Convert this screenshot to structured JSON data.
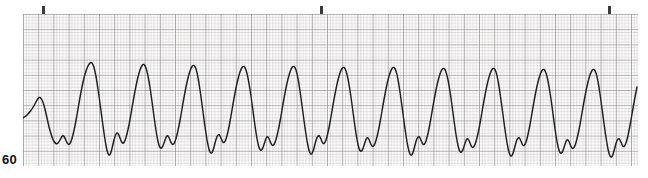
{
  "figure": {
    "name": "ecg-rhythm-strip",
    "kind": "ecg-rhythm-strip",
    "rate_label": "60",
    "background_color": "#ffffff",
    "trace_color": "#1f1f1f",
    "grid_minor_color": "#b9b2b2",
    "grid_major_color": "#8d8585",
    "tick_color": "#3a3a3a",
    "strip": {
      "left": 23,
      "top": 14,
      "width": 615,
      "height": 152,
      "minor_cell_px": 3.04,
      "major_cell_px": 15.2,
      "baseline_y": 104
    },
    "time_ticks": [
      {
        "label": "",
        "x": 19
      },
      {
        "label": "",
        "x": 297
      },
      {
        "label": "",
        "x": 585
      }
    ]
  },
  "chart_data": {
    "type": "line",
    "title": "",
    "subtitle": "",
    "xlabel": "",
    "ylabel": "",
    "grid": "on",
    "legend": "none",
    "annotations": [
      {
        "text": "60",
        "position": "bottom-left",
        "meaning": "rate-marker"
      }
    ],
    "axis": {
      "x_unit": "seconds",
      "y_unit": "millivolts",
      "paper_speed_mm_per_s": 25,
      "gain_mm_per_mV": 10,
      "minor_division_mm": 1,
      "major_division_mm": 5,
      "x_range_s": [
        0,
        6.07
      ],
      "y_range_mV": [
        -2.0,
        3.0
      ]
    },
    "series": [
      {
        "name": "ECG lead trace",
        "beats": 14,
        "beat_period_px": 42.0,
        "first_beat_offset_px": 6,
        "points": [
          [
            0,
            104
          ],
          [
            3,
            102
          ],
          [
            6,
            99
          ],
          [
            9,
            95
          ],
          [
            12,
            90
          ],
          [
            14,
            86
          ],
          [
            16,
            83
          ],
          [
            18,
            84
          ],
          [
            20,
            88
          ],
          [
            22,
            95
          ],
          [
            24,
            104
          ],
          [
            26,
            113
          ],
          [
            28,
            120
          ],
          [
            30,
            126
          ],
          [
            32,
            129
          ],
          [
            34,
            130
          ],
          [
            36,
            128
          ],
          [
            38,
            124
          ],
          [
            40,
            121
          ],
          [
            42,
            124
          ],
          [
            44,
            129
          ],
          [
            46,
            131
          ],
          [
            48,
            128
          ],
          [
            50,
            121
          ],
          [
            52,
            112
          ],
          [
            54,
            101
          ],
          [
            56,
            89
          ],
          [
            58,
            78
          ],
          [
            60,
            68
          ],
          [
            62,
            60
          ],
          [
            64,
            54
          ],
          [
            66,
            50
          ],
          [
            68,
            48
          ],
          [
            70,
            50
          ],
          [
            72,
            57
          ],
          [
            74,
            68
          ],
          [
            76,
            82
          ],
          [
            78,
            97
          ],
          [
            80,
            112
          ],
          [
            82,
            126
          ],
          [
            84,
            137
          ],
          [
            86,
            142
          ],
          [
            88,
            139
          ],
          [
            90,
            130
          ],
          [
            92,
            122
          ],
          [
            94,
            118
          ],
          [
            96,
            121
          ],
          [
            98,
            127
          ],
          [
            100,
            130
          ],
          [
            102,
            127
          ],
          [
            104,
            120
          ],
          [
            106,
            111
          ],
          [
            108,
            100
          ],
          [
            110,
            88
          ],
          [
            112,
            77
          ],
          [
            114,
            67
          ],
          [
            116,
            59
          ],
          [
            118,
            53
          ],
          [
            120,
            50
          ],
          [
            122,
            51
          ],
          [
            124,
            57
          ],
          [
            126,
            67
          ],
          [
            128,
            80
          ],
          [
            130,
            95
          ],
          [
            132,
            110
          ],
          [
            134,
            123
          ],
          [
            136,
            132
          ],
          [
            138,
            135
          ],
          [
            140,
            132
          ],
          [
            142,
            126
          ],
          [
            144,
            121
          ],
          [
            146,
            123
          ],
          [
            148,
            129
          ],
          [
            150,
            131
          ],
          [
            152,
            128
          ],
          [
            154,
            121
          ],
          [
            156,
            112
          ],
          [
            158,
            101
          ],
          [
            160,
            89
          ],
          [
            162,
            78
          ],
          [
            164,
            68
          ],
          [
            166,
            60
          ],
          [
            168,
            54
          ],
          [
            170,
            51
          ],
          [
            172,
            52
          ],
          [
            174,
            58
          ],
          [
            176,
            69
          ],
          [
            178,
            83
          ],
          [
            180,
            98
          ],
          [
            182,
            113
          ],
          [
            184,
            126
          ],
          [
            186,
            136
          ],
          [
            188,
            140
          ],
          [
            190,
            137
          ],
          [
            192,
            129
          ],
          [
            194,
            122
          ],
          [
            196,
            120
          ],
          [
            198,
            124
          ],
          [
            200,
            129
          ],
          [
            202,
            128
          ],
          [
            204,
            122
          ],
          [
            206,
            113
          ],
          [
            208,
            102
          ],
          [
            210,
            90
          ],
          [
            212,
            79
          ],
          [
            214,
            69
          ],
          [
            216,
            61
          ],
          [
            218,
            55
          ],
          [
            220,
            52
          ],
          [
            222,
            53
          ],
          [
            224,
            59
          ],
          [
            226,
            69
          ],
          [
            228,
            82
          ],
          [
            230,
            97
          ],
          [
            232,
            112
          ],
          [
            234,
            125
          ],
          [
            236,
            134
          ],
          [
            238,
            137
          ],
          [
            240,
            134
          ],
          [
            242,
            127
          ],
          [
            244,
            122
          ],
          [
            246,
            124
          ],
          [
            248,
            130
          ],
          [
            250,
            132
          ],
          [
            252,
            129
          ],
          [
            254,
            122
          ],
          [
            256,
            113
          ],
          [
            258,
            102
          ],
          [
            260,
            90
          ],
          [
            262,
            79
          ],
          [
            264,
            69
          ],
          [
            266,
            61
          ],
          [
            268,
            55
          ],
          [
            270,
            52
          ],
          [
            272,
            53
          ],
          [
            274,
            59
          ],
          [
            276,
            70
          ],
          [
            278,
            84
          ],
          [
            280,
            99
          ],
          [
            282,
            114
          ],
          [
            284,
            127
          ],
          [
            286,
            137
          ],
          [
            288,
            141
          ],
          [
            290,
            138
          ],
          [
            292,
            130
          ],
          [
            294,
            123
          ],
          [
            296,
            121
          ],
          [
            298,
            125
          ],
          [
            300,
            130
          ],
          [
            302,
            129
          ],
          [
            304,
            123
          ],
          [
            306,
            114
          ],
          [
            308,
            103
          ],
          [
            310,
            91
          ],
          [
            312,
            80
          ],
          [
            314,
            70
          ],
          [
            316,
            62
          ],
          [
            318,
            56
          ],
          [
            320,
            53
          ],
          [
            322,
            54
          ],
          [
            324,
            60
          ],
          [
            326,
            70
          ],
          [
            328,
            83
          ],
          [
            330,
            98
          ],
          [
            332,
            113
          ],
          [
            334,
            126
          ],
          [
            336,
            135
          ],
          [
            338,
            138
          ],
          [
            340,
            135
          ],
          [
            342,
            128
          ],
          [
            344,
            123
          ],
          [
            346,
            125
          ],
          [
            348,
            131
          ],
          [
            350,
            133
          ],
          [
            352,
            130
          ],
          [
            354,
            123
          ],
          [
            356,
            114
          ],
          [
            358,
            103
          ],
          [
            360,
            91
          ],
          [
            362,
            80
          ],
          [
            364,
            70
          ],
          [
            366,
            62
          ],
          [
            368,
            56
          ],
          [
            370,
            53
          ],
          [
            372,
            54
          ],
          [
            374,
            60
          ],
          [
            376,
            71
          ],
          [
            378,
            85
          ],
          [
            380,
            100
          ],
          [
            382,
            115
          ],
          [
            384,
            128
          ],
          [
            386,
            138
          ],
          [
            388,
            142
          ],
          [
            390,
            139
          ],
          [
            392,
            131
          ],
          [
            394,
            124
          ],
          [
            396,
            122
          ],
          [
            398,
            126
          ],
          [
            400,
            131
          ],
          [
            402,
            130
          ],
          [
            404,
            124
          ],
          [
            406,
            115
          ],
          [
            408,
            104
          ],
          [
            410,
            92
          ],
          [
            412,
            81
          ],
          [
            414,
            71
          ],
          [
            416,
            63
          ],
          [
            418,
            57
          ],
          [
            420,
            54
          ],
          [
            422,
            55
          ],
          [
            424,
            61
          ],
          [
            426,
            71
          ],
          [
            428,
            84
          ],
          [
            430,
            99
          ],
          [
            432,
            114
          ],
          [
            434,
            127
          ],
          [
            436,
            136
          ],
          [
            438,
            139
          ],
          [
            440,
            136
          ],
          [
            442,
            129
          ],
          [
            444,
            124
          ],
          [
            446,
            126
          ],
          [
            448,
            132
          ],
          [
            450,
            134
          ],
          [
            452,
            131
          ],
          [
            454,
            124
          ],
          [
            456,
            115
          ],
          [
            458,
            104
          ],
          [
            460,
            92
          ],
          [
            462,
            81
          ],
          [
            464,
            71
          ],
          [
            466,
            63
          ],
          [
            468,
            57
          ],
          [
            470,
            54
          ],
          [
            472,
            55
          ],
          [
            474,
            61
          ],
          [
            476,
            72
          ],
          [
            478,
            86
          ],
          [
            480,
            101
          ],
          [
            482,
            116
          ],
          [
            484,
            129
          ],
          [
            486,
            139
          ],
          [
            488,
            143
          ],
          [
            490,
            140
          ],
          [
            492,
            132
          ],
          [
            494,
            125
          ],
          [
            496,
            123
          ],
          [
            498,
            127
          ],
          [
            500,
            132
          ],
          [
            502,
            131
          ],
          [
            504,
            125
          ],
          [
            506,
            116
          ],
          [
            508,
            105
          ],
          [
            510,
            93
          ],
          [
            512,
            82
          ],
          [
            514,
            72
          ],
          [
            516,
            64
          ],
          [
            518,
            58
          ],
          [
            520,
            55
          ],
          [
            522,
            56
          ],
          [
            524,
            62
          ],
          [
            526,
            72
          ],
          [
            528,
            85
          ],
          [
            530,
            100
          ],
          [
            532,
            115
          ],
          [
            534,
            128
          ],
          [
            536,
            137
          ],
          [
            538,
            140
          ],
          [
            540,
            137
          ],
          [
            542,
            130
          ],
          [
            544,
            125
          ],
          [
            546,
            127
          ],
          [
            548,
            133
          ],
          [
            550,
            135
          ],
          [
            552,
            132
          ],
          [
            554,
            125
          ],
          [
            556,
            116
          ],
          [
            558,
            105
          ],
          [
            560,
            93
          ],
          [
            562,
            82
          ],
          [
            564,
            72
          ],
          [
            566,
            64
          ],
          [
            568,
            58
          ],
          [
            570,
            55
          ],
          [
            572,
            56
          ],
          [
            574,
            62
          ],
          [
            576,
            73
          ],
          [
            578,
            87
          ],
          [
            580,
            102
          ],
          [
            582,
            117
          ],
          [
            584,
            130
          ],
          [
            586,
            140
          ],
          [
            588,
            144
          ],
          [
            590,
            141
          ],
          [
            592,
            133
          ],
          [
            594,
            126
          ],
          [
            596,
            124
          ],
          [
            598,
            128
          ],
          [
            600,
            133
          ],
          [
            602,
            132
          ],
          [
            604,
            126
          ],
          [
            606,
            117
          ],
          [
            608,
            106
          ],
          [
            610,
            94
          ],
          [
            612,
            83
          ],
          [
            614,
            73
          ]
        ]
      }
    ]
  }
}
